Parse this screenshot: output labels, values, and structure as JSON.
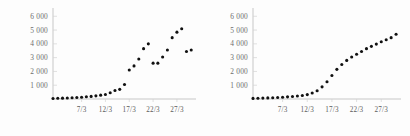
{
  "figure": {
    "background_color": "#fdfdfd",
    "dot_color": "#111111",
    "axis_color": "#b9b9b9",
    "label_color": "#6d6d6d"
  },
  "chart_data": [
    {
      "type": "scatter",
      "title": "",
      "subtitle": "",
      "xlabel": "",
      "ylabel": "",
      "panel": "left",
      "grid": false,
      "legend": "none",
      "xlim": [
        1,
        31
      ],
      "ylim": [
        0,
        6600
      ],
      "yticks": [
        1000,
        2000,
        3000,
        4000,
        5000,
        6000
      ],
      "ytick_labels": [
        "1 000",
        "2 000",
        "3 000",
        "4 000",
        "5 000",
        "6 000"
      ],
      "xticks": [
        7,
        12,
        17,
        22,
        27
      ],
      "xtick_labels": [
        "7/3",
        "12/3",
        "17/3",
        "22/3",
        "27/3"
      ],
      "x": [
        1,
        2,
        3,
        4,
        5,
        6,
        7,
        8,
        9,
        10,
        11,
        12,
        13,
        14,
        15,
        16,
        17,
        18,
        19,
        20,
        21,
        22,
        23,
        24,
        25,
        26,
        27,
        28,
        29,
        30
      ],
      "values": [
        40,
        50,
        60,
        70,
        90,
        110,
        130,
        160,
        190,
        230,
        280,
        330,
        450,
        620,
        700,
        1050,
        2100,
        2400,
        2900,
        3650,
        4000,
        2600,
        2600,
        3050,
        3550,
        4450,
        4850,
        5100,
        3450,
        3550
      ],
      "annotations": [
        "highest point about 6200 on last day"
      ]
    },
    {
      "type": "scatter",
      "title": "",
      "subtitle": "",
      "xlabel": "",
      "ylabel": "",
      "panel": "right",
      "grid": false,
      "legend": "none",
      "xlim": [
        1,
        31
      ],
      "ylim": [
        0,
        6600
      ],
      "yticks": [
        1000,
        2000,
        3000,
        4000,
        5000,
        6000
      ],
      "ytick_labels": [
        "1 000",
        "2 000",
        "3 000",
        "4 000",
        "5 000",
        "6 000"
      ],
      "xticks": [
        7,
        12,
        17,
        22,
        27
      ],
      "xtick_labels": [
        "7/3",
        "12/3",
        "17/3",
        "22/3",
        "27/3"
      ],
      "x": [
        1,
        2,
        3,
        4,
        5,
        6,
        7,
        8,
        9,
        10,
        11,
        12,
        13,
        14,
        15,
        16,
        17,
        18,
        19,
        20,
        21,
        22,
        23,
        24,
        25,
        26,
        27,
        28,
        29,
        30
      ],
      "values": [
        45,
        55,
        65,
        80,
        95,
        110,
        130,
        155,
        185,
        215,
        255,
        320,
        430,
        600,
        880,
        1250,
        1700,
        2150,
        2500,
        2800,
        3050,
        3250,
        3450,
        3650,
        3820,
        3980,
        4150,
        4300,
        4450,
        4700
      ],
      "annotations": [
        "smooth S-shaped curve ending near 4700"
      ]
    }
  ]
}
